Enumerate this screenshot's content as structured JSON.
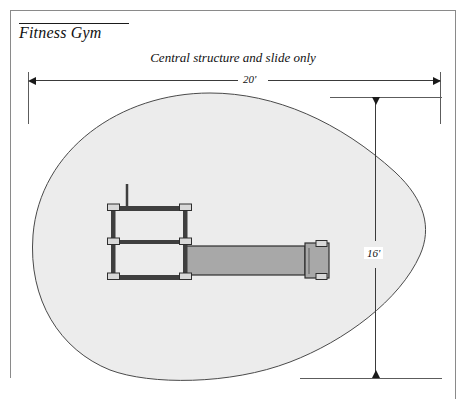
{
  "document": {
    "title": "Fitness Gym",
    "subtitle": "Central structure and slide only"
  },
  "dimensions": {
    "width_label": "20'",
    "height_label": "16'"
  },
  "colors": {
    "use_zone_fill": "#ececec",
    "use_zone_stroke": "#4a4a4a",
    "structure_dark": "#3f3f3f",
    "structure_node": "#d8d8d8",
    "slide_fill": "#a8a8a8",
    "slide_stroke": "#2e2e2e",
    "dimension_line": "#3a3a3a",
    "frame_line": "#8a8a8a",
    "page_background": "#ffffff"
  },
  "geometry": {
    "use_zone_path": "M 210 93 C 120 93, 40 150, 33 235 C 28 300, 60 350, 110 370 C 150 385, 230 385, 290 362 C 345 341, 400 300, 420 255 C 432 228, 425 200, 395 172 C 340 122, 275 93, 210 93 Z",
    "horizontal_dimension_y": 80,
    "vertical_dimension_x": 375,
    "extension_left_x": 28,
    "extension_right_x": 440,
    "extension_top_y": 97,
    "extension_bottom_y": 378
  },
  "structure_parts": {
    "frame_label": "central-structure-frame",
    "slide_label": "slide",
    "pole_label": "vertical-pole",
    "node_label": "joint-connector"
  }
}
